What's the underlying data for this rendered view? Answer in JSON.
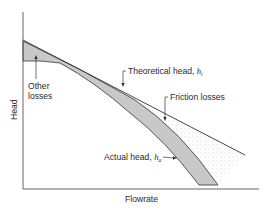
{
  "diagram": {
    "axes": {
      "x_label": "Flowrate",
      "y_label": "Head"
    },
    "labels": {
      "other_losses_line1": "Other",
      "other_losses_line2": "losses",
      "theoretical_head": "Theoretical head, ",
      "theoretical_head_symbol": "h",
      "theoretical_head_subscript": "i",
      "friction_losses": "Friction losses",
      "actual_head": "Actual head, ",
      "actual_head_symbol": "h",
      "actual_head_subscript": "a"
    },
    "colors": {
      "line": "#333333",
      "shaded_other_losses": "#c8c8c8",
      "friction_dots": "#9a9a9a",
      "background": "#ffffff"
    },
    "regions": [
      {
        "name": "Other losses",
        "style": "gray fill",
        "between": "friction curve and actual head curve"
      },
      {
        "name": "Friction losses",
        "style": "stippled",
        "between": "theoretical head line and friction curve"
      }
    ]
  }
}
